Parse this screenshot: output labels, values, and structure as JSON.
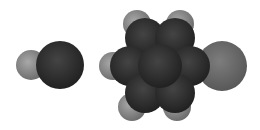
{
  "figure": {
    "background": "#ffffff",
    "molecules": [
      {
        "name": "diatomic-molecule",
        "atoms": [
          {
            "element": "light",
            "cx": 31,
            "cy": 65,
            "r": 15,
            "color": "#8c8c8c"
          },
          {
            "element": "dark",
            "cx": 60,
            "cy": 65,
            "r": 24,
            "color": "#2f2f2f"
          }
        ]
      },
      {
        "name": "substituted-benzene",
        "ring_color": "#2b2b2b",
        "atoms": [
          {
            "element": "H",
            "cx": 137,
            "cy": 24,
            "r": 14,
            "color": "#8a8a8a"
          },
          {
            "element": "H",
            "cx": 180,
            "cy": 24,
            "r": 14,
            "color": "#8a8a8a"
          },
          {
            "element": "H",
            "cx": 113,
            "cy": 66,
            "r": 14,
            "color": "#8a8a8a"
          },
          {
            "element": "H",
            "cx": 132,
            "cy": 107,
            "r": 14,
            "color": "#8a8a8a"
          },
          {
            "element": "H",
            "cx": 177,
            "cy": 107,
            "r": 14,
            "color": "#8a8a8a"
          },
          {
            "element": "X",
            "cx": 222,
            "cy": 66,
            "r": 25,
            "color": "#6e6e6e"
          }
        ]
      }
    ]
  }
}
